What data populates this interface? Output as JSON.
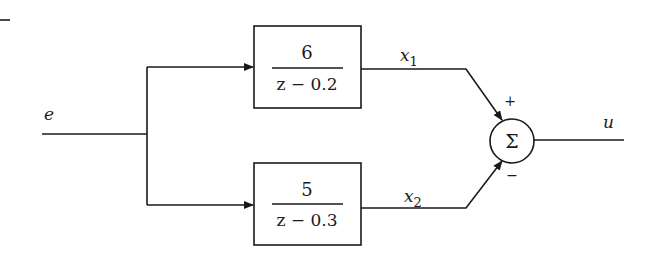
{
  "diagram": {
    "type": "block-diagram",
    "input_signal": "e",
    "output_signal": "u",
    "blocks": [
      {
        "id": "block1",
        "numerator": "6",
        "denominator": "z − 0.2",
        "output": "x",
        "output_sub": "1"
      },
      {
        "id": "block2",
        "numerator": "5",
        "denominator": "z − 0.3",
        "output": "x",
        "output_sub": "2"
      }
    ],
    "summer": {
      "symbol": "Σ",
      "top_sign": "+",
      "bottom_sign": "−"
    },
    "corner_mark": "—"
  }
}
